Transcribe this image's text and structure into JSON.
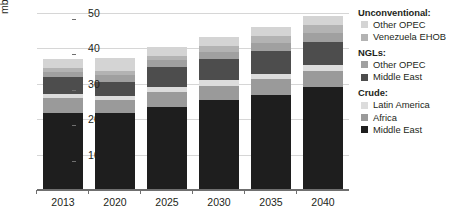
{
  "chart": {
    "type": "bar",
    "ylabel": "mb/d"
  },
  "legend": {
    "groups": [
      {
        "title": "Unconventional:",
        "items": [
          {
            "label": "Other OPEC",
            "color": "#d4d4d4",
            "key": "unconv_other_opec"
          },
          {
            "label": "Venezuela EHOB",
            "color": "#b3b3b3",
            "key": "unconv_venezuela_ehob"
          }
        ]
      },
      {
        "title": "NGLs:",
        "items": [
          {
            "label": "Other OPEC",
            "color": "#a0a0a0",
            "key": "ngl_other_opec"
          },
          {
            "label": "Middle East",
            "color": "#4d4d4d",
            "key": "ngl_middle_east"
          }
        ]
      },
      {
        "title": "Crude:",
        "items": [
          {
            "label": "Latin America",
            "color": "#dcdcdc",
            "key": "crude_latin_america"
          },
          {
            "label": "Africa",
            "color": "#9a9a9a",
            "key": "crude_africa"
          },
          {
            "label": "Middle East",
            "color": "#1e1e1e",
            "key": "crude_middle_east"
          }
        ]
      }
    ]
  },
  "chart_data": {
    "type": "bar",
    "stacked": true,
    "title": "",
    "xlabel": "",
    "ylabel": "mb/d",
    "ylim": [
      0,
      50
    ],
    "yticks": [
      10,
      20,
      30,
      40,
      50
    ],
    "grid": true,
    "legend_position": "right",
    "categories": [
      "2013",
      "2020",
      "2025",
      "2030",
      "2035",
      "2040"
    ],
    "series": [
      {
        "name": "Crude: Middle East",
        "color": "#1e1e1e",
        "values": [
          21.7,
          21.8,
          23.4,
          25.4,
          26.9,
          29.1
        ]
      },
      {
        "name": "Crude: Africa",
        "color": "#9a9a9a",
        "values": [
          4.2,
          3.6,
          4.4,
          4.0,
          4.4,
          4.5
        ]
      },
      {
        "name": "Crude: Latin America",
        "color": "#dcdcdc",
        "values": [
          1.3,
          1.1,
          1.3,
          1.6,
          1.6,
          1.7
        ]
      },
      {
        "name": "NGLs: Middle East",
        "color": "#4d4d4d",
        "values": [
          4.6,
          4.1,
          5.6,
          6.0,
          6.3,
          6.6
        ]
      },
      {
        "name": "NGLs: Other OPEC",
        "color": "#a0a0a0",
        "values": [
          1.6,
          1.8,
          1.9,
          2.1,
          2.4,
          2.4
        ]
      },
      {
        "name": "Unconventional: Venezuela EHOB",
        "color": "#b3b3b3",
        "values": [
          1.0,
          1.2,
          1.4,
          1.7,
          2.0,
          2.3
        ]
      },
      {
        "name": "Unconventional: Other OPEC",
        "color": "#d4d4d4",
        "values": [
          2.6,
          3.7,
          2.3,
          2.4,
          2.6,
          2.7
        ]
      }
    ],
    "totals": [
      37.0,
      37.3,
      40.3,
      43.2,
      46.2,
      49.3
    ]
  }
}
